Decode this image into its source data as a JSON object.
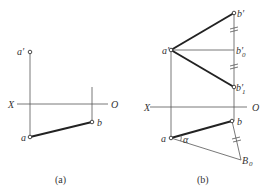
{
  "panels": [
    {
      "id": "a",
      "caption": "(a)",
      "axis": {
        "left_label": "X",
        "right_label": "O"
      },
      "points": {
        "a_prime": "a′",
        "a": "a",
        "b": "b"
      }
    },
    {
      "id": "b",
      "caption": "(b)",
      "axis": {
        "left_label": "X",
        "right_label": "O"
      },
      "points": {
        "a_prime": "a′",
        "b_prime": "b′",
        "b0_prime": "b′",
        "b0_prime_sub": "0",
        "b1_prime": "b′",
        "b1_prime_sub": "1",
        "a": "a",
        "b": "b",
        "B0": "B",
        "B0_sub": "0",
        "alpha": "α"
      }
    }
  ]
}
